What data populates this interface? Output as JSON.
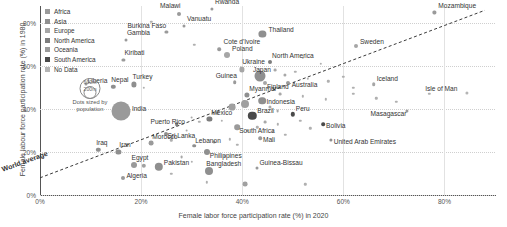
{
  "chart_data": {
    "type": "scatter",
    "title": "",
    "xlabel": "Female labor force participation rate (%) in 2020",
    "ylabel": "Female labour force participation rate (%) in 1980",
    "xlim": [
      0,
      90
    ],
    "ylim": [
      0,
      88
    ],
    "xticks": [
      "0%",
      "20%",
      "40%",
      "60%",
      "80%"
    ],
    "xtick_values": [
      0,
      20,
      40,
      60,
      80
    ],
    "yticks": [
      "0%",
      "20%",
      "40%",
      "60%",
      "80%"
    ],
    "ytick_values": [
      0,
      20,
      40,
      60,
      80
    ],
    "grid": true,
    "legend_position": "top-left",
    "reference_line": {
      "label": "World average",
      "style": "dashed",
      "from": [
        0,
        8
      ],
      "to": [
        88,
        86
      ]
    },
    "size_legend": {
      "caption_line1": "Dots sized by",
      "caption_line2": "population",
      "large_label": "600m",
      "small_label": "200m"
    },
    "legend": [
      {
        "label": "Africa",
        "color": "#9a9a9a"
      },
      {
        "label": "Asia",
        "color": "#8f8f8f"
      },
      {
        "label": "Europe",
        "color": "#a6a6a6"
      },
      {
        "label": "North America",
        "color": "#7d7d7d"
      },
      {
        "label": "Oceania",
        "color": "#9a9a9a"
      },
      {
        "label": "South America",
        "color": "#4a4a4a"
      },
      {
        "label": "No Data",
        "color": "#b5b5b5"
      }
    ],
    "points": [
      {
        "name": "Malawi",
        "x": 27.5,
        "y": 84.5,
        "r": 2.0,
        "color": "#9a9a9a",
        "lx": -19,
        "ly": -8
      },
      {
        "name": "Rwanda",
        "x": 34.0,
        "y": 86.5,
        "r": 1.6,
        "color": "#9a9a9a",
        "lx": 3,
        "ly": -7
      },
      {
        "name": "Mozambique",
        "x": 78.0,
        "y": 85.0,
        "r": 1.6,
        "color": "#9a9a9a",
        "lx": 4,
        "ly": -6
      },
      {
        "name": "Vanuatu",
        "x": 28.5,
        "y": 78.5,
        "r": 1.5,
        "color": "#9a9a9a",
        "lx": 3,
        "ly": -7
      },
      {
        "name": "Burkina Faso",
        "x": 25.0,
        "y": 76.0,
        "r": 1.6,
        "color": "#9a9a9a",
        "lx": -39,
        "ly": -6
      },
      {
        "name": "Thailand",
        "x": 44.0,
        "y": 75.0,
        "r": 3.6,
        "color": "#8f8f8f",
        "lx": 6,
        "ly": -4
      },
      {
        "name": "Gambia",
        "x": 17.0,
        "y": 72.0,
        "r": 1.5,
        "color": "#9a9a9a",
        "lx": 1,
        "ly": -7
      },
      {
        "name": "Cote d'Ivoire",
        "x": 35.5,
        "y": 68.0,
        "r": 1.8,
        "color": "#9a9a9a",
        "lx": 4,
        "ly": -7
      },
      {
        "name": "Poland",
        "x": 37.0,
        "y": 65.0,
        "r": 3.0,
        "color": "#a6a6a6",
        "lx": 5,
        "ly": -6
      },
      {
        "name": "Sweden",
        "x": 62.5,
        "y": 69.5,
        "r": 2.0,
        "color": "#a6a6a6",
        "lx": 4,
        "ly": -4
      },
      {
        "name": "Kiribati",
        "x": 16.5,
        "y": 63.0,
        "r": 1.6,
        "color": "#9a9a9a",
        "lx": 1,
        "ly": -7
      },
      {
        "name": "North America",
        "x": 45.5,
        "y": 62.0,
        "r": 2.0,
        "color": "#7d7d7d",
        "lx": 2,
        "ly": -6
      },
      {
        "name": "Ukraine",
        "x": 40.0,
        "y": 58.5,
        "r": 2.6,
        "color": "#a6a6a6",
        "lx": 0,
        "ly": -7
      },
      {
        "name": "Japan",
        "x": 43.5,
        "y": 55.5,
        "r": 5.5,
        "color": "#8f8f8f",
        "lx": -7,
        "ly": -6
      },
      {
        "name": "Finland",
        "x": 44.5,
        "y": 52.0,
        "r": 2.0,
        "color": "#a6a6a6",
        "lx": 2,
        "ly": 4
      },
      {
        "name": "Australia",
        "x": 49.0,
        "y": 52.0,
        "r": 2.0,
        "color": "#9a9a9a",
        "lx": 4,
        "ly": 2
      },
      {
        "name": "Iceland",
        "x": 66.0,
        "y": 51.5,
        "r": 1.8,
        "color": "#a6a6a6",
        "lx": 3,
        "ly": -5
      },
      {
        "name": "Isle of Man",
        "x": 84.5,
        "y": 47.5,
        "r": 1.6,
        "color": "#b5b5b5",
        "lx": -42,
        "ly": -4
      },
      {
        "name": "Liberia",
        "x": 9.0,
        "y": 51.5,
        "r": 1.5,
        "color": "#9a9a9a",
        "lx": 2,
        "ly": -3
      },
      {
        "name": "Nepal",
        "x": 14.5,
        "y": 50.5,
        "r": 2.2,
        "color": "#8f8f8f",
        "lx": -2,
        "ly": -7
      },
      {
        "name": "Turkey",
        "x": 18.5,
        "y": 51.5,
        "r": 2.6,
        "color": "#8f8f8f",
        "lx": -1,
        "ly": -7
      },
      {
        "name": "Guinea",
        "x": 38.5,
        "y": 52.5,
        "r": 1.8,
        "color": "#9a9a9a",
        "lx": -19,
        "ly": -6
      },
      {
        "name": "Myanmar",
        "x": 41.0,
        "y": 46.5,
        "r": 2.6,
        "color": "#8f8f8f",
        "lx": 2,
        "ly": -6
      },
      {
        "name": "Indonesia",
        "x": 44.0,
        "y": 44.0,
        "r": 3.8,
        "color": "#8f8f8f",
        "lx": 4,
        "ly": 1
      },
      {
        "name": "India",
        "x": 16.0,
        "y": 39.0,
        "r": 9.5,
        "color": "#9a9a9a",
        "lx": 11,
        "ly": -2
      },
      {
        "name": "Brazil",
        "x": 42.0,
        "y": 37.0,
        "r": 4.2,
        "color": "#4a4a4a",
        "lx": 5,
        "ly": -5
      },
      {
        "name": "Peru",
        "x": 50.0,
        "y": 37.5,
        "r": 2.2,
        "color": "#4a4a4a",
        "lx": 3,
        "ly": -5
      },
      {
        "name": "Mexico",
        "x": 33.5,
        "y": 35.5,
        "r": 2.6,
        "color": "#7d7d7d",
        "lx": 2,
        "ly": -6
      },
      {
        "name": "Puerto Rico",
        "x": 27.0,
        "y": 33.0,
        "r": 1.8,
        "color": "#7d7d7d",
        "lx": -26,
        "ly": -2
      },
      {
        "name": "South Africa",
        "x": 39.0,
        "y": 31.5,
        "r": 2.8,
        "color": "#9a9a9a",
        "lx": 2,
        "ly": 4
      },
      {
        "name": "Bolivia",
        "x": 56.0,
        "y": 33.0,
        "r": 1.8,
        "color": "#4a4a4a",
        "lx": 3,
        "ly": 2
      },
      {
        "name": "Sri Lanka",
        "x": 25.0,
        "y": 28.5,
        "r": 2.0,
        "color": "#8f8f8f",
        "lx": 1,
        "ly": 2
      },
      {
        "name": "Mali",
        "x": 43.5,
        "y": 26.5,
        "r": 1.8,
        "color": "#9a9a9a",
        "lx": 3,
        "ly": 2
      },
      {
        "name": "United Arab Emirates",
        "x": 57.5,
        "y": 25.5,
        "r": 1.6,
        "color": "#8f8f8f",
        "lx": 3,
        "ly": 2
      },
      {
        "name": "Masagascar",
        "x": 72.5,
        "y": 39.0,
        "r": 1.6,
        "color": "#9a9a9a",
        "lx": -36,
        "ly": 3
      },
      {
        "name": "Morocco",
        "x": 22.0,
        "y": 24.0,
        "r": 2.4,
        "color": "#9a9a9a",
        "lx": 1,
        "ly": -6
      },
      {
        "name": "Lebanon",
        "x": 30.5,
        "y": 23.0,
        "r": 1.8,
        "color": "#8f8f8f",
        "lx": 1,
        "ly": -5
      },
      {
        "name": "Iraq",
        "x": 11.5,
        "y": 21.0,
        "r": 2.2,
        "color": "#8f8f8f",
        "lx": -2,
        "ly": -7
      },
      {
        "name": "Iran",
        "x": 15.5,
        "y": 20.0,
        "r": 2.6,
        "color": "#8f8f8f",
        "lx": 1,
        "ly": -7
      },
      {
        "name": "Egypt",
        "x": 18.5,
        "y": 14.0,
        "r": 3.0,
        "color": "#9a9a9a",
        "lx": -2,
        "ly": -7
      },
      {
        "name": "Pakistan",
        "x": 23.5,
        "y": 13.0,
        "r": 4.2,
        "color": "#8f8f8f",
        "lx": 5,
        "ly": -4
      },
      {
        "name": "Algeria",
        "x": 16.5,
        "y": 8.0,
        "r": 2.0,
        "color": "#9a9a9a",
        "lx": 3,
        "ly": -2
      },
      {
        "name": "Bangladesh",
        "x": 33.5,
        "y": 11.0,
        "r": 4.0,
        "color": "#8f8f8f",
        "lx": -3,
        "ly": -7
      },
      {
        "name": "Philippines",
        "x": 33.0,
        "y": 20.0,
        "r": 3.0,
        "color": "#8f8f8f",
        "lx": 3,
        "ly": 4
      },
      {
        "name": "Guinea-Bissau",
        "x": 43.0,
        "y": 12.5,
        "r": 1.5,
        "color": "#9a9a9a",
        "lx": 2,
        "ly": -5
      }
    ],
    "unlabeled_points": [
      {
        "x": 22.0,
        "y": 80.5,
        "r": 1.2,
        "color": "#b0b0b0"
      },
      {
        "x": 30.5,
        "y": 70.0,
        "r": 1.2,
        "color": "#b0b0b0"
      },
      {
        "x": 52.0,
        "y": 64.0,
        "r": 1.2,
        "color": "#b0b0b0"
      },
      {
        "x": 55.5,
        "y": 61.0,
        "r": 1.2,
        "color": "#b0b0b0"
      },
      {
        "x": 20.5,
        "y": 50.0,
        "r": 1.2,
        "color": "#b0b0b0"
      },
      {
        "x": 46.5,
        "y": 58.0,
        "r": 1.4,
        "color": "#a8a8a8"
      },
      {
        "x": 48.5,
        "y": 56.0,
        "r": 1.6,
        "color": "#a8a8a8"
      },
      {
        "x": 50.5,
        "y": 57.5,
        "r": 1.2,
        "color": "#b0b0b0"
      },
      {
        "x": 53.0,
        "y": 54.0,
        "r": 1.2,
        "color": "#b0b0b0"
      },
      {
        "x": 57.0,
        "y": 53.0,
        "r": 1.2,
        "color": "#b0b0b0"
      },
      {
        "x": 60.0,
        "y": 55.0,
        "r": 1.2,
        "color": "#b0b0b0"
      },
      {
        "x": 62.0,
        "y": 50.0,
        "r": 1.2,
        "color": "#b0b0b0"
      },
      {
        "x": 47.5,
        "y": 47.0,
        "r": 1.4,
        "color": "#a8a8a8"
      },
      {
        "x": 52.0,
        "y": 46.0,
        "r": 1.2,
        "color": "#b0b0b0"
      },
      {
        "x": 56.5,
        "y": 44.5,
        "r": 1.2,
        "color": "#b0b0b0"
      },
      {
        "x": 70.5,
        "y": 43.5,
        "r": 1.2,
        "color": "#b0b0b0"
      },
      {
        "x": 45.5,
        "y": 41.0,
        "r": 1.6,
        "color": "#a8a8a8"
      },
      {
        "x": 47.0,
        "y": 39.0,
        "r": 1.4,
        "color": "#a8a8a8"
      },
      {
        "x": 38.0,
        "y": 41.0,
        "r": 3.4,
        "color": "#a0a0a0"
      },
      {
        "x": 40.5,
        "y": 42.5,
        "r": 4.0,
        "color": "#a0a0a0"
      },
      {
        "x": 35.0,
        "y": 38.0,
        "r": 1.4,
        "color": "#a8a8a8"
      },
      {
        "x": 30.0,
        "y": 36.0,
        "r": 1.4,
        "color": "#a8a8a8"
      },
      {
        "x": 31.5,
        "y": 34.0,
        "r": 1.2,
        "color": "#b0b0b0"
      },
      {
        "x": 36.0,
        "y": 34.5,
        "r": 1.2,
        "color": "#b0b0b0"
      },
      {
        "x": 44.5,
        "y": 34.0,
        "r": 1.4,
        "color": "#a8a8a8"
      },
      {
        "x": 47.0,
        "y": 33.0,
        "r": 1.2,
        "color": "#b0b0b0"
      },
      {
        "x": 51.5,
        "y": 34.5,
        "r": 1.2,
        "color": "#b0b0b0"
      },
      {
        "x": 53.5,
        "y": 31.0,
        "r": 1.2,
        "color": "#b0b0b0"
      },
      {
        "x": 41.0,
        "y": 30.0,
        "r": 1.2,
        "color": "#b0b0b0"
      },
      {
        "x": 43.0,
        "y": 31.5,
        "r": 1.2,
        "color": "#b0b0b0"
      },
      {
        "x": 46.0,
        "y": 29.5,
        "r": 1.2,
        "color": "#b0b0b0"
      },
      {
        "x": 48.5,
        "y": 28.0,
        "r": 1.2,
        "color": "#b0b0b0"
      },
      {
        "x": 29.0,
        "y": 30.0,
        "r": 1.4,
        "color": "#a8a8a8"
      },
      {
        "x": 26.0,
        "y": 25.5,
        "r": 1.2,
        "color": "#b0b0b0"
      },
      {
        "x": 34.5,
        "y": 24.5,
        "r": 1.4,
        "color": "#a8a8a8"
      },
      {
        "x": 37.5,
        "y": 26.0,
        "r": 1.2,
        "color": "#b0b0b0"
      },
      {
        "x": 39.0,
        "y": 23.5,
        "r": 1.2,
        "color": "#b0b0b0"
      },
      {
        "x": 28.0,
        "y": 17.5,
        "r": 1.4,
        "color": "#a8a8a8"
      },
      {
        "x": 20.5,
        "y": 13.5,
        "r": 2.2,
        "color": "#a0a0a0"
      },
      {
        "x": 26.0,
        "y": 10.0,
        "r": 1.2,
        "color": "#b0b0b0"
      },
      {
        "x": 30.0,
        "y": 15.5,
        "r": 1.2,
        "color": "#b0b0b0"
      },
      {
        "x": 36.5,
        "y": 18.0,
        "r": 1.2,
        "color": "#b0b0b0"
      },
      {
        "x": 33.0,
        "y": 6.0,
        "r": 1.2,
        "color": "#b0b0b0"
      },
      {
        "x": 40.5,
        "y": 5.0,
        "r": 2.4,
        "color": "#a0a0a0"
      },
      {
        "x": 52.5,
        "y": 5.0,
        "r": 1.2,
        "color": "#b0b0b0"
      },
      {
        "x": 62.0,
        "y": 47.0,
        "r": 1.2,
        "color": "#b0b0b0"
      },
      {
        "x": 66.5,
        "y": 45.0,
        "r": 1.2,
        "color": "#b0b0b0"
      },
      {
        "x": 77.0,
        "y": 47.0,
        "r": 1.2,
        "color": "#b0b0b0"
      }
    ]
  }
}
